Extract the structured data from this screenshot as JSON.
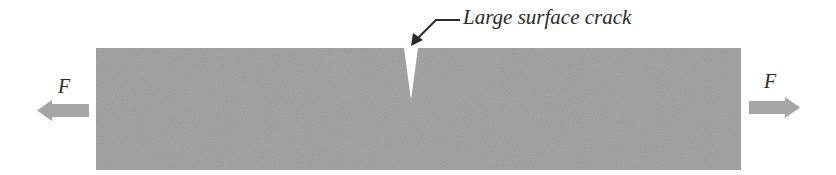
{
  "diagram": {
    "crack_label": "Large surface crack",
    "force_left_label": "F",
    "force_right_label": "F",
    "colors": {
      "bar": "#9a9a9a",
      "arrow": "#a5a5a5",
      "crack": "#ffffff",
      "leader": "#2a2a2a"
    }
  }
}
